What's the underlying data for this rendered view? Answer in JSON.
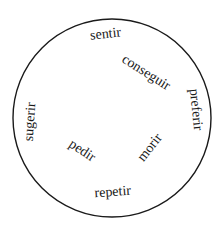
{
  "diagram": {
    "type": "word-circle",
    "circle": {
      "cx": 112,
      "cy": 118,
      "r": 99,
      "stroke": "#1a1a1a",
      "stroke_width": 1.4
    },
    "words": [
      {
        "id": "sentir",
        "text": "sentir",
        "x": 106,
        "y": 38,
        "rotate": -6
      },
      {
        "id": "conseguir",
        "text": "conseguir",
        "x": 144,
        "y": 76,
        "rotate": 32
      },
      {
        "id": "preferir",
        "text": "preferir",
        "x": 192,
        "y": 110,
        "rotate": 84
      },
      {
        "id": "sugerir",
        "text": "sugerir",
        "x": 34,
        "y": 122,
        "rotate": -86
      },
      {
        "id": "pedir",
        "text": "pedir",
        "x": 80,
        "y": 154,
        "rotate": 34
      },
      {
        "id": "morir",
        "text": "morir",
        "x": 153,
        "y": 150,
        "rotate": -52
      },
      {
        "id": "repetir",
        "text": "repetir",
        "x": 113,
        "y": 196,
        "rotate": -4
      }
    ]
  }
}
